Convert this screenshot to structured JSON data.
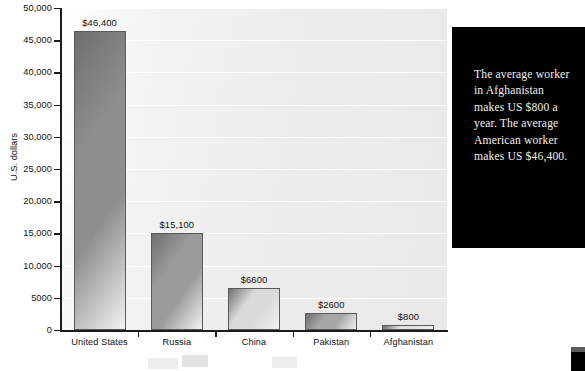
{
  "chart_data": {
    "type": "bar",
    "title": "",
    "xlabel": "",
    "ylabel": "U.S. dollars",
    "categories": [
      "United States",
      "Russia",
      "China",
      "Pakistan",
      "Afghanistan"
    ],
    "values": [
      46400,
      15100,
      6600,
      2600,
      800
    ],
    "value_labels": [
      "$46,400",
      "$15,100",
      "$6600",
      "$2600",
      "$800"
    ],
    "ylim": [
      0,
      50000
    ],
    "ytick_values": [
      0,
      5000,
      10000,
      15000,
      20000,
      25000,
      30000,
      35000,
      40000,
      45000,
      50000
    ],
    "ytick_labels": [
      "0",
      "5000",
      "10,000",
      "15,000",
      "20,000",
      "25,000",
      "30,000",
      "35,000",
      "40,000",
      "45,000",
      "50,000"
    ],
    "grid": "horizontal",
    "legend": "none",
    "bar_colors": [
      "#8e8e8e",
      "#9b9b9b",
      "#dadada",
      "#a7a7a7",
      "#e2e2e2"
    ],
    "bar_border_color": "#5a5a5a"
  },
  "callout": {
    "text": "The average worker in Afghanistan makes US $800 a year. The average American worker makes US $46,400.",
    "background": "#000000",
    "text_color": "#f2f0ec"
  },
  "axis": {
    "line_color": "#1b1b1b",
    "plot_background": "#efefef",
    "gridline_color": "#ffffff"
  }
}
